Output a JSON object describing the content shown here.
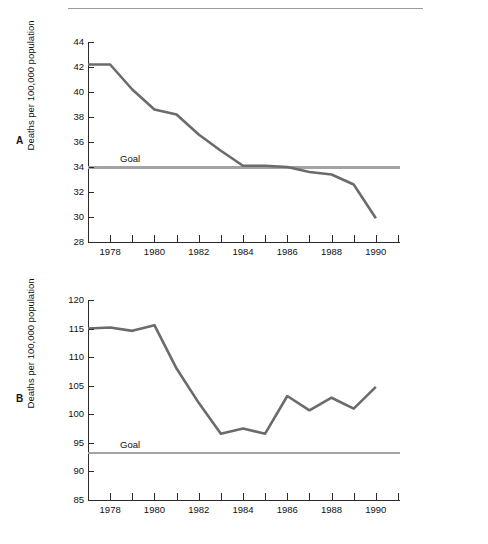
{
  "figure": {
    "top_rule": "horizontal-rule",
    "panels": [
      {
        "letter": "A",
        "y_axis_title": "Deaths per 100,000 population",
        "goal_label": "Goal"
      },
      {
        "letter": "B",
        "y_axis_title": "Deaths per 100,000 population",
        "goal_label": "Goal"
      }
    ]
  },
  "chart_data": [
    {
      "type": "line",
      "title": "",
      "panel": "A",
      "xlabel": "",
      "ylabel": "Deaths per 100,000 population",
      "xlim": [
        1977,
        1991
      ],
      "ylim": [
        28,
        44
      ],
      "xticks": [
        1977,
        1978,
        1979,
        1980,
        1981,
        1982,
        1983,
        1984,
        1985,
        1986,
        1987,
        1988,
        1989,
        1990,
        1991
      ],
      "xtick_labels": [
        "",
        "1978",
        "",
        "1980",
        "",
        "1982",
        "",
        "1984",
        "",
        "1986",
        "",
        "1988",
        "",
        "1990",
        ""
      ],
      "yticks": [
        28,
        30,
        32,
        34,
        36,
        38,
        40,
        42,
        44
      ],
      "ytick_labels": [
        "28",
        "30",
        "32",
        "34",
        "36",
        "38",
        "40",
        "42",
        "44"
      ],
      "grid": false,
      "legend": "none",
      "x": [
        1977,
        1978,
        1979,
        1980,
        1981,
        1982,
        1983,
        1984,
        1985,
        1986,
        1987,
        1988,
        1989,
        1990
      ],
      "series": [
        {
          "name": "Death rate",
          "values": [
            42.2,
            42.2,
            40.2,
            38.6,
            38.2,
            36.6,
            35.3,
            34.1,
            34.1,
            34.0,
            33.6,
            33.4,
            32.6,
            29.9
          ]
        }
      ],
      "annotations": [
        {
          "label": "Goal",
          "type": "hline",
          "value": 34.0
        }
      ]
    },
    {
      "type": "line",
      "title": "",
      "panel": "B",
      "xlabel": "",
      "ylabel": "Deaths per 100,000 population",
      "xlim": [
        1977,
        1991
      ],
      "ylim": [
        85,
        120
      ],
      "xticks": [
        1977,
        1978,
        1979,
        1980,
        1981,
        1982,
        1983,
        1984,
        1985,
        1986,
        1987,
        1988,
        1989,
        1990,
        1991
      ],
      "xtick_labels": [
        "",
        "1978",
        "",
        "1980",
        "",
        "1982",
        "",
        "1984",
        "",
        "1986",
        "",
        "1988",
        "",
        "1990",
        ""
      ],
      "yticks": [
        85,
        90,
        95,
        100,
        105,
        110,
        115,
        120
      ],
      "ytick_labels": [
        "85",
        "90",
        "95",
        "100",
        "105",
        "110",
        "115",
        "120"
      ],
      "grid": false,
      "legend": "none",
      "x": [
        1977,
        1978,
        1979,
        1980,
        1981,
        1982,
        1983,
        1984,
        1985,
        1986,
        1987,
        1988,
        1989,
        1990
      ],
      "series": [
        {
          "name": "Death rate",
          "values": [
            115.0,
            115.2,
            114.6,
            115.6,
            108.0,
            102.0,
            96.6,
            97.5,
            96.6,
            103.2,
            100.7,
            102.9,
            101.0,
            104.8
          ]
        }
      ],
      "annotations": [
        {
          "label": "Goal",
          "type": "hline",
          "value": 93.3
        }
      ]
    }
  ],
  "colors": {
    "series_line": "#6b6b6b",
    "goal_line": "#a3a3a3",
    "axis": "#2b2b2b",
    "text": "#111111",
    "background": "#ffffff"
  }
}
